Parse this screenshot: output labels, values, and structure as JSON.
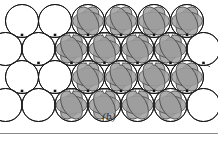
{
  "figure": {
    "caption": "(b)",
    "panel_label": "b",
    "canvas": {
      "width": 218,
      "height": 122
    },
    "colors": {
      "background": "#ffffff",
      "circle_stroke": "#1a1a1a",
      "circle_fill": "#ffffff",
      "lens_fill": "#9d9d9d",
      "lens_stroke": "#3a3a3a",
      "marker_fill": "#111111",
      "junction_stroke": "#1f1f1f",
      "rule": "#8a8a8a",
      "caption_text": "#2b2b2b"
    },
    "geometry": {
      "circle_radius": 16.5,
      "row_spacing": 28.0,
      "column_spacing": 33.0,
      "lens_radius_x": 15.5,
      "lens_radius_y": 9.0,
      "marker_size": 2.6,
      "stroke_width": 1.0
    },
    "rows": [
      {
        "index": 0,
        "cy": 21.0,
        "x_start": 22.0,
        "count": 6,
        "shaded_from": 2
      },
      {
        "index": 1,
        "cy": 49.0,
        "x_start": 5.5,
        "count": 7,
        "shaded_from": 3
      },
      {
        "index": 2,
        "cy": 77.0,
        "x_start": 22.0,
        "count": 6,
        "shaded_from": 2
      },
      {
        "index": 3,
        "cy": 105.0,
        "x_start": 5.5,
        "count": 7,
        "shaded_from": 3
      }
    ],
    "lens_rows": [
      {
        "cy": 21.0,
        "x_start": 88.0,
        "count": 4,
        "orientations": [
          -60,
          0,
          60
        ]
      },
      {
        "cy": 49.0,
        "x_start": 71.5,
        "count": 4,
        "orientations": [
          -60,
          0,
          60
        ]
      },
      {
        "cy": 77.0,
        "x_start": 88.0,
        "count": 4,
        "orientations": [
          -60,
          0,
          60
        ]
      },
      {
        "cy": 105.0,
        "x_start": 71.5,
        "count": 4,
        "orientations": [
          -60,
          0,
          60
        ]
      }
    ],
    "markers": [
      {
        "x": 22.0,
        "y": 35.0
      },
      {
        "x": 55.0,
        "y": 35.0
      },
      {
        "x": 88.0,
        "y": 35.0
      },
      {
        "x": 121.0,
        "y": 35.0
      },
      {
        "x": 154.0,
        "y": 35.0
      },
      {
        "x": 187.0,
        "y": 35.0
      },
      {
        "x": 22.0,
        "y": 91.0
      },
      {
        "x": 55.0,
        "y": 91.0
      },
      {
        "x": 88.0,
        "y": 91.0
      },
      {
        "x": 121.0,
        "y": 91.0
      },
      {
        "x": 154.0,
        "y": 91.0
      },
      {
        "x": 187.0,
        "y": 91.0
      },
      {
        "x": 38.5,
        "y": 63.0
      },
      {
        "x": 71.5,
        "y": 63.0
      },
      {
        "x": 104.5,
        "y": 63.0
      },
      {
        "x": 137.5,
        "y": 63.0
      },
      {
        "x": 170.5,
        "y": 63.0
      },
      {
        "x": 203.5,
        "y": 63.0
      }
    ],
    "interstices": [
      {
        "x": 71.5,
        "y": 35.0,
        "type": "octahedral"
      },
      {
        "x": 104.5,
        "y": 35.0,
        "type": "octahedral"
      },
      {
        "x": 137.5,
        "y": 35.0,
        "type": "octahedral"
      },
      {
        "x": 170.5,
        "y": 35.0,
        "type": "octahedral"
      },
      {
        "x": 88.0,
        "y": 63.0,
        "type": "octahedral"
      },
      {
        "x": 121.0,
        "y": 63.0,
        "type": "octahedral"
      },
      {
        "x": 154.0,
        "y": 63.0,
        "type": "octahedral"
      },
      {
        "x": 71.5,
        "y": 91.0,
        "type": "octahedral"
      },
      {
        "x": 104.5,
        "y": 91.0,
        "type": "octahedral"
      },
      {
        "x": 137.5,
        "y": 91.0,
        "type": "octahedral"
      }
    ]
  }
}
